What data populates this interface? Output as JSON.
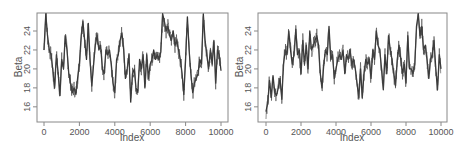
{
  "chart_data": [
    {
      "type": "line",
      "title": "",
      "xlabel": "Index",
      "ylabel": "Beta",
      "xlim": [
        -400,
        10400
      ],
      "ylim": [
        14.4,
        25.9
      ],
      "xticks": [
        0,
        2000,
        4000,
        6000,
        8000,
        10000
      ],
      "yticks": [
        16,
        18,
        20,
        22,
        24
      ],
      "grid": false,
      "legend": null,
      "series": [
        {
          "name": "Beta trace (chain 1)",
          "color": "#333333",
          "x": [
            0,
            100,
            200,
            300,
            400,
            500,
            600,
            700,
            800,
            900,
            1000,
            1100,
            1200,
            1300,
            1400,
            1500,
            1600,
            1700,
            1800,
            1900,
            2000,
            2100,
            2200,
            2300,
            2400,
            2500,
            2600,
            2700,
            2800,
            2900,
            3000,
            3100,
            3200,
            3300,
            3400,
            3500,
            3600,
            3700,
            3800,
            3900,
            4000,
            4100,
            4200,
            4300,
            4400,
            4500,
            4600,
            4700,
            4800,
            4900,
            5000,
            5100,
            5200,
            5300,
            5400,
            5500,
            5600,
            5700,
            5800,
            5900,
            6000,
            6100,
            6200,
            6300,
            6400,
            6500,
            6600,
            6700,
            6800,
            6900,
            7000,
            7100,
            7200,
            7300,
            7400,
            7500,
            7600,
            7700,
            7800,
            7900,
            8000,
            8100,
            8200,
            8300,
            8400,
            8500,
            8600,
            8700,
            8800,
            8900,
            9000,
            9100,
            9200,
            9300,
            9400,
            9500,
            9600,
            9700,
            9800,
            9900,
            10000
          ],
          "values": [
            22.0,
            25.8,
            23.5,
            22.0,
            21.5,
            19.8,
            18.0,
            21.5,
            19.5,
            17.2,
            21.0,
            20.0,
            23.5,
            22.0,
            19.5,
            18.5,
            17.5,
            18.0,
            17.3,
            19.0,
            20.5,
            23.5,
            25.0,
            23.0,
            21.0,
            24.8,
            21.0,
            18.2,
            20.5,
            22.5,
            23.5,
            22.0,
            22.5,
            20.0,
            19.5,
            22.0,
            21.5,
            22.0,
            20.5,
            18.5,
            17.5,
            21.0,
            21.5,
            23.0,
            23.8,
            22.0,
            19.0,
            20.0,
            21.5,
            16.5,
            19.5,
            20.0,
            18.0,
            17.5,
            21.0,
            20.0,
            21.5,
            18.0,
            21.5,
            19.0,
            20.5,
            21.0,
            22.0,
            21.0,
            21.5,
            21.0,
            21.8,
            25.8,
            25.0,
            24.0,
            24.5,
            23.5,
            23.0,
            24.0,
            22.5,
            23.0,
            22.0,
            21.0,
            19.5,
            17.3,
            21.0,
            25.5,
            22.0,
            19.5,
            17.5,
            18.5,
            19.0,
            19.5,
            21.0,
            20.5,
            25.8,
            23.0,
            21.5,
            20.0,
            22.0,
            20.5,
            23.0,
            18.5,
            22.0,
            21.5,
            19.8
          ]
        }
      ]
    },
    {
      "type": "line",
      "title": "",
      "xlabel": "Index",
      "ylabel": "Beta",
      "xlim": [
        -450,
        10400
      ],
      "ylim": [
        14.4,
        25.9
      ],
      "xticks": [
        0,
        2000,
        4000,
        6000,
        8000,
        10000
      ],
      "yticks": [
        16,
        18,
        20,
        22,
        24
      ],
      "grid": false,
      "legend": null,
      "series": [
        {
          "name": "Beta trace (chain 2)",
          "color": "#333333",
          "x": [
            0,
            100,
            200,
            300,
            400,
            500,
            600,
            700,
            800,
            900,
            1000,
            1100,
            1200,
            1300,
            1400,
            1500,
            1600,
            1700,
            1800,
            1900,
            2000,
            2100,
            2200,
            2300,
            2400,
            2500,
            2600,
            2700,
            2800,
            2900,
            3000,
            3100,
            3200,
            3300,
            3400,
            3500,
            3600,
            3700,
            3800,
            3900,
            4000,
            4100,
            4200,
            4300,
            4400,
            4500,
            4600,
            4700,
            4800,
            4900,
            5000,
            5100,
            5200,
            5300,
            5400,
            5500,
            5600,
            5700,
            5800,
            5900,
            6000,
            6100,
            6200,
            6300,
            6400,
            6500,
            6600,
            6700,
            6800,
            6900,
            7000,
            7100,
            7200,
            7300,
            7400,
            7500,
            7600,
            7700,
            7800,
            7900,
            8000,
            8100,
            8200,
            8300,
            8400,
            8500,
            8600,
            8700,
            8800,
            8900,
            9000,
            9100,
            9200,
            9300,
            9400,
            9500,
            9600,
            9700,
            9800,
            9900,
            10000
          ],
          "values": [
            15.5,
            16.5,
            18.8,
            17.0,
            19.3,
            17.5,
            17.2,
            18.0,
            19.0,
            16.8,
            20.5,
            22.0,
            21.5,
            24.0,
            22.0,
            20.5,
            21.5,
            24.2,
            21.5,
            22.0,
            19.5,
            23.0,
            20.5,
            22.5,
            20.0,
            24.0,
            22.0,
            22.5,
            23.0,
            23.5,
            22.5,
            19.5,
            18.0,
            20.5,
            22.0,
            21.5,
            24.5,
            21.0,
            21.5,
            19.0,
            20.0,
            21.0,
            21.5,
            21.0,
            22.0,
            19.5,
            21.5,
            21.0,
            22.0,
            20.5,
            21.0,
            20.0,
            18.5,
            17.0,
            20.0,
            17.0,
            19.5,
            21.0,
            20.5,
            21.0,
            19.0,
            22.0,
            21.0,
            24.0,
            22.5,
            22.0,
            20.0,
            17.8,
            21.5,
            19.5,
            23.5,
            22.0,
            21.0,
            19.5,
            18.2,
            21.0,
            22.5,
            21.0,
            19.5,
            20.5,
            18.5,
            23.5,
            20.0,
            20.0,
            19.5,
            20.5,
            24.5,
            25.8,
            23.5,
            24.5,
            22.0,
            22.5,
            21.0,
            19.0,
            21.0,
            21.5,
            23.0,
            20.0,
            17.8,
            21.5,
            20.0
          ]
        }
      ]
    }
  ],
  "panels": [
    {
      "ylabel": "Beta",
      "xlabel": "Index",
      "xtick_labels": [
        "0",
        "2000",
        "4000",
        "6000",
        "8000",
        "10000"
      ],
      "ytick_labels": [
        "16",
        "18",
        "20",
        "22",
        "24"
      ]
    },
    {
      "ylabel": "Beta",
      "xlabel": "Index",
      "xtick_labels": [
        "0",
        "2000",
        "4000",
        "6000",
        "8000",
        "10000"
      ],
      "ytick_labels": [
        "16",
        "18",
        "20",
        "22",
        "24"
      ]
    }
  ],
  "colors": {
    "line": "#333333",
    "axis": "#888888",
    "text": "#555555"
  }
}
